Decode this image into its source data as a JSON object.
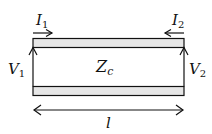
{
  "diagram": {
    "colors": {
      "line": "#111111",
      "conductor_fill": "#e6e6e6",
      "background": "#ffffff"
    },
    "labels": {
      "current_in": {
        "main": "I",
        "sub": "1"
      },
      "current_out": {
        "main": "I",
        "sub": "2"
      },
      "voltage_in": {
        "main": "V",
        "sub": "1"
      },
      "voltage_out": {
        "main": "V",
        "sub": "2"
      },
      "impedance": {
        "main": "Z",
        "sub": "c"
      },
      "length": {
        "main": "l"
      }
    },
    "elements": [
      {
        "id": "top-conductor",
        "type": "strip"
      },
      {
        "id": "bottom-conductor",
        "type": "strip"
      },
      {
        "id": "port1-voltage-arrow",
        "direction": "up"
      },
      {
        "id": "port2-voltage-arrow",
        "direction": "up"
      },
      {
        "id": "i1-arrow",
        "direction": "right"
      },
      {
        "id": "i2-arrow",
        "direction": "left"
      },
      {
        "id": "length-dimension",
        "direction": "both"
      }
    ]
  }
}
